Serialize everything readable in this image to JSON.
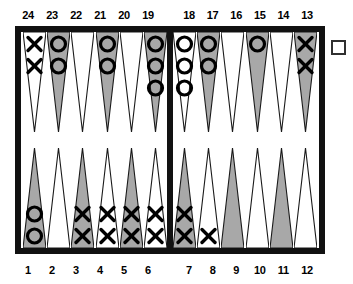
{
  "figure": {
    "board_border_color": "#111111",
    "point_shaded_color": "#a8a8a8",
    "point_plain_color": "#ffffff",
    "checker_color": "#000000"
  },
  "labels": {
    "top_left": [
      "24",
      "23",
      "22",
      "21",
      "20",
      "19"
    ],
    "top_right": [
      "18",
      "17",
      "16",
      "15",
      "14",
      "13"
    ],
    "bottom_left": [
      "1",
      "2",
      "3",
      "4",
      "5",
      "6"
    ],
    "bottom_right": [
      "7",
      "8",
      "9",
      "10",
      "11",
      "12"
    ]
  },
  "doubling_cube": {
    "label": "",
    "present": true
  },
  "chart_data": {
    "type": "table",
    "xlabel": "",
    "ylabel": "",
    "legend": [
      "X = player X checker",
      "O = player O checker"
    ],
    "categories": [
      "24",
      "23",
      "22",
      "21",
      "20",
      "19",
      "18",
      "17",
      "16",
      "15",
      "14",
      "13",
      "12",
      "11",
      "10",
      "9",
      "8",
      "7",
      "6",
      "5",
      "4",
      "3",
      "2",
      "1"
    ],
    "values": [
      2,
      2,
      0,
      2,
      0,
      3,
      3,
      2,
      0,
      1,
      0,
      2,
      0,
      0,
      0,
      0,
      1,
      2,
      2,
      2,
      2,
      2,
      0,
      2
    ],
    "points": [
      {
        "number": "24",
        "row": "top",
        "half": "left",
        "shaded": false,
        "checker": "X",
        "count": 2
      },
      {
        "number": "23",
        "row": "top",
        "half": "left",
        "shaded": true,
        "checker": "O",
        "count": 2
      },
      {
        "number": "22",
        "row": "top",
        "half": "left",
        "shaded": false,
        "checker": "",
        "count": 0
      },
      {
        "number": "21",
        "row": "top",
        "half": "left",
        "shaded": true,
        "checker": "O",
        "count": 2
      },
      {
        "number": "20",
        "row": "top",
        "half": "left",
        "shaded": false,
        "checker": "",
        "count": 0
      },
      {
        "number": "19",
        "row": "top",
        "half": "left",
        "shaded": true,
        "checker": "O",
        "count": 3
      },
      {
        "number": "18",
        "row": "top",
        "half": "right",
        "shaded": false,
        "checker": "O",
        "count": 3
      },
      {
        "number": "17",
        "row": "top",
        "half": "right",
        "shaded": true,
        "checker": "O",
        "count": 2
      },
      {
        "number": "16",
        "row": "top",
        "half": "right",
        "shaded": false,
        "checker": "",
        "count": 0
      },
      {
        "number": "15",
        "row": "top",
        "half": "right",
        "shaded": true,
        "checker": "O",
        "count": 1
      },
      {
        "number": "14",
        "row": "top",
        "half": "right",
        "shaded": false,
        "checker": "",
        "count": 0
      },
      {
        "number": "13",
        "row": "top",
        "half": "right",
        "shaded": true,
        "checker": "X",
        "count": 2
      },
      {
        "number": "1",
        "row": "bottom",
        "half": "left",
        "shaded": true,
        "checker": "O",
        "count": 2
      },
      {
        "number": "2",
        "row": "bottom",
        "half": "left",
        "shaded": false,
        "checker": "",
        "count": 0
      },
      {
        "number": "3",
        "row": "bottom",
        "half": "left",
        "shaded": true,
        "checker": "X",
        "count": 2
      },
      {
        "number": "4",
        "row": "bottom",
        "half": "left",
        "shaded": false,
        "checker": "X",
        "count": 2
      },
      {
        "number": "5",
        "row": "bottom",
        "half": "left",
        "shaded": true,
        "checker": "X",
        "count": 2
      },
      {
        "number": "6",
        "row": "bottom",
        "half": "left",
        "shaded": false,
        "checker": "X",
        "count": 2
      },
      {
        "number": "7",
        "row": "bottom",
        "half": "right",
        "shaded": true,
        "checker": "X",
        "count": 2
      },
      {
        "number": "8",
        "row": "bottom",
        "half": "right",
        "shaded": false,
        "checker": "X",
        "count": 1
      },
      {
        "number": "9",
        "row": "bottom",
        "half": "right",
        "shaded": true,
        "checker": "",
        "count": 0
      },
      {
        "number": "10",
        "row": "bottom",
        "half": "right",
        "shaded": false,
        "checker": "",
        "count": 0
      },
      {
        "number": "11",
        "row": "bottom",
        "half": "right",
        "shaded": true,
        "checker": "",
        "count": 0
      },
      {
        "number": "12",
        "row": "bottom",
        "half": "right",
        "shaded": false,
        "checker": "",
        "count": 0
      }
    ]
  }
}
